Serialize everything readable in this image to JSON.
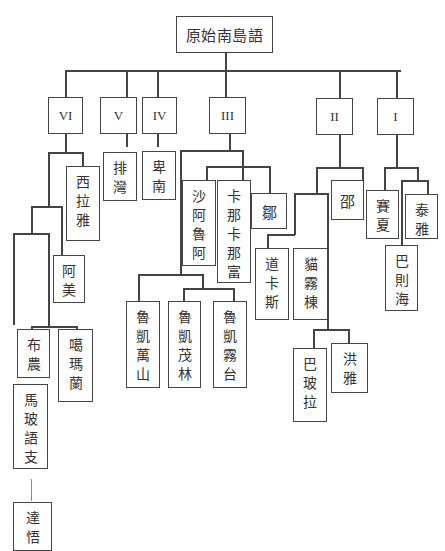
{
  "diagram": {
    "title": "原始南島語",
    "type": "language-family-tree",
    "colors": {
      "line": "#444444",
      "box_border": "#444444",
      "text": "#333333",
      "background": "#ffffff"
    },
    "root": {
      "label": "原始南島語"
    },
    "branches": [
      {
        "id": "VI",
        "label": "VI"
      },
      {
        "id": "V",
        "label": "V"
      },
      {
        "id": "IV",
        "label": "IV"
      },
      {
        "id": "III",
        "label": "III"
      },
      {
        "id": "II",
        "label": "II"
      },
      {
        "id": "I",
        "label": "I"
      }
    ],
    "languages": {
      "siraya": "西拉雅",
      "amis": "阿美",
      "bunun": "布農",
      "kavalan": "噶瑪蘭",
      "malayo_polynesian": "馬玻語支",
      "tao": "達悟",
      "paiwan": "排灣",
      "puyuma": "卑南",
      "saaroa": "沙阿魯阿",
      "kanakanavu": "卡那卡那富",
      "tsou": "鄒",
      "rukai_mantauran": "魯凱萬山",
      "rukai_maga": "魯凱茂林",
      "rukai_budai": "魯凱霧台",
      "thao": "邵",
      "taokas": "道卡斯",
      "babuza": "貓霧棟",
      "papora": "巴玻拉",
      "hoanya": "洪雅",
      "saisiyat": "賽夏",
      "atayal": "泰雅",
      "pazeh": "巴則海"
    }
  }
}
